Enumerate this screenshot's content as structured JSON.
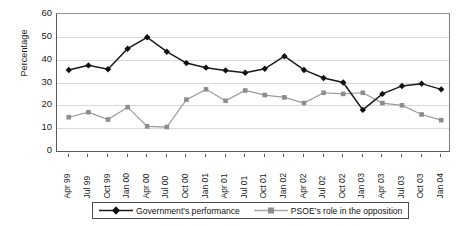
{
  "chart_data": {
    "type": "line",
    "title": "",
    "xlabel": "",
    "ylabel": "Percentage",
    "ylim": [
      0,
      60
    ],
    "ytick_labels": [
      "60",
      "50",
      "40",
      "30",
      "20",
      "10",
      "0"
    ],
    "yticks": [
      60,
      50,
      40,
      30,
      20,
      10,
      0
    ],
    "grid": true,
    "legend_position": "bottom",
    "categories": [
      "Apr 99",
      "Jul 99",
      "Oct 99",
      "Jan 00",
      "Apr 00",
      "Jul 00",
      "Oct 00",
      "Jan 01",
      "Apr 01",
      "Jul 01",
      "Oct 01",
      "Jan 02",
      "Apr 02",
      "Jul 02",
      "Oct 02",
      "Jan 03",
      "Apr 03",
      "Jul 03",
      "Oct 03",
      "Jan 04"
    ],
    "series": [
      {
        "name": "Government's performance",
        "color": "#1a1a1a",
        "marker": "diamond",
        "values": [
          35.5,
          37.5,
          35.8,
          44.8,
          49.8,
          43.5,
          38.5,
          36.5,
          35.3,
          34.3,
          36.0,
          41.5,
          35.5,
          32.0,
          30.0,
          18.0,
          25.0,
          28.5,
          29.5,
          27.0
        ]
      },
      {
        "name": "PSOE's role in the opposition",
        "color": "#9a9a9a",
        "marker": "square",
        "values": [
          14.8,
          17.0,
          13.8,
          19.2,
          10.8,
          10.5,
          22.5,
          27.0,
          22.0,
          26.5,
          24.5,
          23.5,
          21.0,
          25.5,
          25.0,
          25.5,
          21.0,
          20.0,
          16.0,
          13.5
        ]
      }
    ]
  },
  "legend": {
    "items": [
      {
        "label": "Government's performance"
      },
      {
        "label": "PSOE's role in the opposition"
      }
    ]
  }
}
